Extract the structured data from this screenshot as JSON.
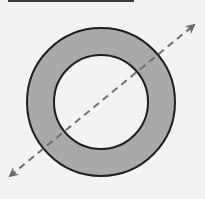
{
  "diagram": {
    "type": "annulus-with-axis",
    "background": "#f3f3f1",
    "top_rule": {
      "x1": 8,
      "x2": 134,
      "y": 1,
      "color": "#3a3a3a",
      "width": 2
    },
    "ring": {
      "cx": 101,
      "cy": 102,
      "outer_r": 74,
      "inner_r": 47,
      "fill": "#a9a9a9",
      "inner_fill": "#f3f3f1",
      "stroke": "#1e1e1e",
      "stroke_width": 2
    },
    "axis": {
      "style": "dashed",
      "double_headed": true,
      "x1": 10,
      "y1": 176,
      "x2": 194,
      "y2": 25,
      "color": "#707070",
      "dash": "7,5",
      "width": 2
    }
  }
}
